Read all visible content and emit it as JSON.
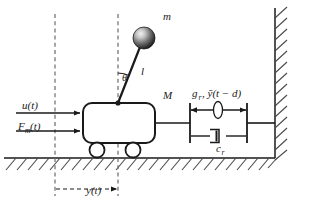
{
  "figure": {
    "colors": {
      "stroke": "#1a1a1a",
      "dashed": "#6b6b6b",
      "hatch": "#4a4a4a",
      "ball_light": "#e8e8e8",
      "ball_mid": "#8a8a8a",
      "ball_dark": "#1c1c1c",
      "background": "#ffffff"
    },
    "labels": {
      "pendulum_mass": "m",
      "pendulum_angle": "θ",
      "pendulum_length": "l",
      "cart_mass": "M",
      "control_input": "u(t)",
      "applied_force_base": "F",
      "applied_force_sub": "m",
      "applied_force_tail": "(t)",
      "displacement": "y(t)",
      "spring_gain_base": "g",
      "spring_gain_sub": "r",
      "spring_gain_tail": ", ỹ(t − d)",
      "damper_base": "c",
      "damper_sub": "r"
    },
    "elements": {
      "cart": "rounded-rectangle",
      "wheels": 2,
      "ground": "hatched-ground-line",
      "wall": "hatched-vertical-wall",
      "spring": "ellipse-with-double-arrow",
      "damper": "dashpot",
      "reference_lines": 2,
      "force_arrows": 2
    }
  }
}
